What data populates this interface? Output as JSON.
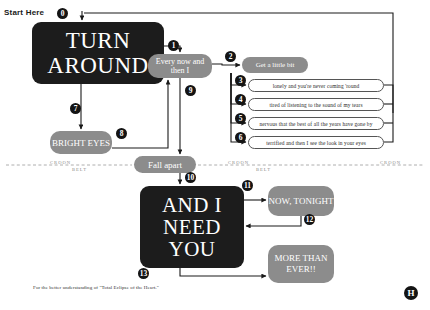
{
  "diagram": {
    "start_label": "Start Here",
    "caption": "For the better understanding of \"Total Eclipse of the Heart.\"",
    "logo": "H"
  },
  "nodes": {
    "turn_around": "TURN AROUND",
    "every_now_and_then": "Every now and then I",
    "bright_eyes": "BRIGHT EYES",
    "fall_apart": "Fall apart",
    "get_a_little_bit": "Get a little bit",
    "and_i_need_you": "AND I NEED YOU",
    "now_tonight": "NOW, TONIGHT",
    "more_than_ever": "MORE THAN EVER!!"
  },
  "lyrics": [
    "lonely and you're never coming 'round",
    "tired of listening to the sound of my tears",
    "nervous that the best of all the years have gone by",
    "terrified and then I see the look in your eyes"
  ],
  "badges": {
    "b0": "0",
    "b1": "1",
    "b2": "2",
    "b3": "3",
    "b4": "4",
    "b5": "5",
    "b6": "6",
    "b7": "7",
    "b8": "8",
    "b9": "9",
    "b10": "10",
    "b11": "11",
    "b12": "12",
    "b13": "13"
  },
  "registers": {
    "croon": "CROON",
    "belt": "BELT"
  },
  "colors": {
    "dark_node": "#1c1c1c",
    "gray_node": "#8c8c8c",
    "white_node": "#ffffff",
    "line": "#1a1a1a",
    "divider": "#9a9a9a"
  }
}
